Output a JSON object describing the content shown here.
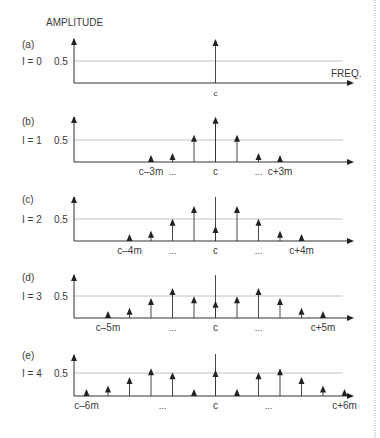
{
  "figure": {
    "y_axis_label": "AMPLITUDE",
    "x_axis_label": "FREQ.",
    "ref_level_label": "0.5",
    "center_label": "c",
    "ellipsis": "...",
    "colors": {
      "axis": "#333333",
      "ref_line": "#b0b0b0",
      "stem": "#333333",
      "border_dots": "#999999"
    }
  },
  "panels": [
    {
      "tag": "(a)",
      "index_label": "I = 0",
      "left_label": "",
      "right_label": "",
      "show_ellipsis": false
    },
    {
      "tag": "(b)",
      "index_label": "I = 1",
      "left_label": "c–3m",
      "right_label": "c+3m",
      "show_ellipsis": true
    },
    {
      "tag": "(c)",
      "index_label": "I = 2",
      "left_label": "c–4m",
      "right_label": "c+4m",
      "show_ellipsis": true
    },
    {
      "tag": "(d)",
      "index_label": "I = 3",
      "left_label": "c–5m",
      "right_label": "c+5m",
      "show_ellipsis": true
    },
    {
      "tag": "(e)",
      "index_label": "I = 4",
      "left_label": "c–6m",
      "right_label": "c+6m",
      "show_ellipsis": true
    }
  ],
  "chart_data": {
    "type": "stem",
    "title": "",
    "xlabel": "FREQ.",
    "ylabel": "AMPLITUDE",
    "reference_line": 0.5,
    "x_unit": "offset from carrier c in multiples of m",
    "series": [
      {
        "name": "(a) I = 0",
        "offsets": [
          0
        ],
        "values": [
          1.0
        ]
      },
      {
        "name": "(b) I = 1",
        "offsets": [
          -3,
          -2,
          -1,
          0,
          1,
          2,
          3
        ],
        "values": [
          0.02,
          0.11,
          0.44,
          0.77,
          0.44,
          0.11,
          0.02
        ]
      },
      {
        "name": "(c) I = 2",
        "offsets": [
          -4,
          -3,
          -2,
          -1,
          0,
          1,
          2,
          3,
          4
        ],
        "values": [
          0.03,
          0.13,
          0.35,
          0.58,
          0.22,
          0.58,
          0.35,
          0.13,
          0.03
        ]
      },
      {
        "name": "(d) I = 3",
        "offsets": [
          -5,
          -4,
          -3,
          -2,
          -1,
          0,
          1,
          2,
          3,
          4,
          5
        ],
        "values": [
          0.04,
          0.13,
          0.31,
          0.49,
          0.34,
          0.26,
          0.34,
          0.49,
          0.31,
          0.13,
          0.04
        ]
      },
      {
        "name": "(e) I = 4",
        "offsets": [
          -6,
          -5,
          -4,
          -3,
          -2,
          -1,
          0,
          1,
          2,
          3,
          4,
          5,
          6
        ],
        "values": [
          0.05,
          0.13,
          0.28,
          0.43,
          0.36,
          0.07,
          0.4,
          0.07,
          0.36,
          0.43,
          0.28,
          0.13,
          0.05
        ]
      }
    ]
  }
}
